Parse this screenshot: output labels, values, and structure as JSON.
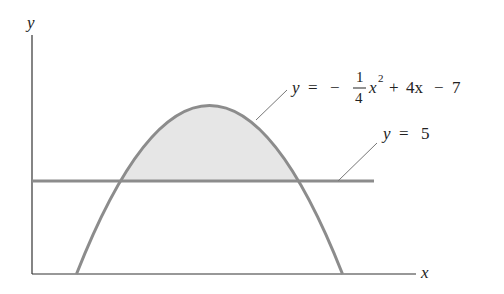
{
  "figure": {
    "axes": {
      "x_label": "x",
      "y_label": "y"
    },
    "curves": [
      {
        "name": "parabola",
        "equation": "y = -1/4 x^2 + 4x - 7",
        "a": -0.25,
        "b": 4,
        "c": -7,
        "color": "#8c8c8c"
      },
      {
        "name": "horizontal-line",
        "equation": "y = 5",
        "value": 5,
        "color": "#8c8c8c"
      }
    ],
    "shaded_region": {
      "description": "region between parabola and y = 5",
      "x_from": 4,
      "x_to": 12,
      "fill": "#e6e6e6"
    },
    "labels": {
      "parabola": {
        "y": "y",
        "eq": "=",
        "minus": "−",
        "num": "1",
        "den": "4",
        "x": "x",
        "exp": "2",
        "rest_plus": "+",
        "rest_4x": "4x",
        "rest_minus": "−",
        "rest_7": "7"
      },
      "line": {
        "y": "y",
        "eq": "=",
        "val": "5"
      }
    }
  }
}
